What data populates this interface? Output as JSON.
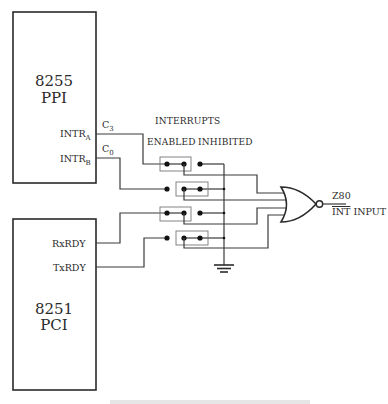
{
  "diagram": {
    "chips": {
      "ppi": {
        "part": "8255",
        "name": "PPI",
        "pins": [
          {
            "label": "INTR",
            "sub": "A",
            "port": "C",
            "port_sub": "3"
          },
          {
            "label": "INTR",
            "sub": "B",
            "port": "C",
            "port_sub": "0"
          }
        ]
      },
      "pci": {
        "part": "8251",
        "name": "PCI",
        "pins": [
          {
            "label": "RxRDY"
          },
          {
            "label": "TxRDY"
          }
        ]
      }
    },
    "switch_header": {
      "title": "INTERRUPTS",
      "enabled": "ENABLED",
      "inhibited": "INHIBITED"
    },
    "switches": [
      {
        "source": "C3 / INTR A",
        "state": "enabled"
      },
      {
        "source": "C0 / INTR B",
        "state": "inhibited"
      },
      {
        "source": "RxRDY",
        "state": "enabled"
      },
      {
        "source": "TxRDY",
        "state": "inhibited"
      }
    ],
    "gate": {
      "type": "NOR",
      "inputs": 4
    },
    "output": {
      "line1": "Z80",
      "line2_over": "INT",
      "line2_rest": " INPUT"
    },
    "ground": "ground",
    "caption": "(caption cut off at bottom edge)"
  },
  "colors": {
    "ink": "#2a2a2a",
    "background": "#ffffff",
    "switch_box": "#777777"
  }
}
